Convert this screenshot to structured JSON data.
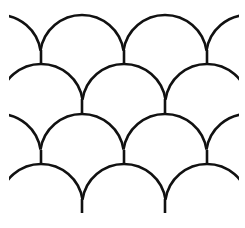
{
  "pattern": {
    "name": "scallop-fan-pattern",
    "background": "#ffffff",
    "stroke": "#111111",
    "stroke_width": 2.6,
    "radius": 42,
    "rows": [
      {
        "peak_y": 15,
        "centers": [
          -1,
          82,
          165,
          248
        ],
        "stems": [
          [
            41,
            50,
            63
          ],
          [
            124,
            50,
            63
          ],
          [
            207,
            50,
            63
          ]
        ]
      },
      {
        "peak_y": 64,
        "centers": [
          41,
          124,
          207
        ],
        "stems": [
          [
            82,
            99,
            113
          ],
          [
            165,
            99,
            113
          ]
        ]
      },
      {
        "peak_y": 114,
        "centers": [
          -1,
          82,
          165,
          248
        ],
        "stems": [
          [
            41,
            150,
            164
          ],
          [
            124,
            150,
            164
          ],
          [
            207,
            150,
            164
          ]
        ]
      },
      {
        "peak_y": 164,
        "centers": [
          41,
          124,
          207
        ],
        "stems": [
          [
            82,
            199,
            213
          ],
          [
            165,
            199,
            213
          ]
        ]
      }
    ],
    "clip": {
      "x_min": 9,
      "x_max": 239
    }
  }
}
